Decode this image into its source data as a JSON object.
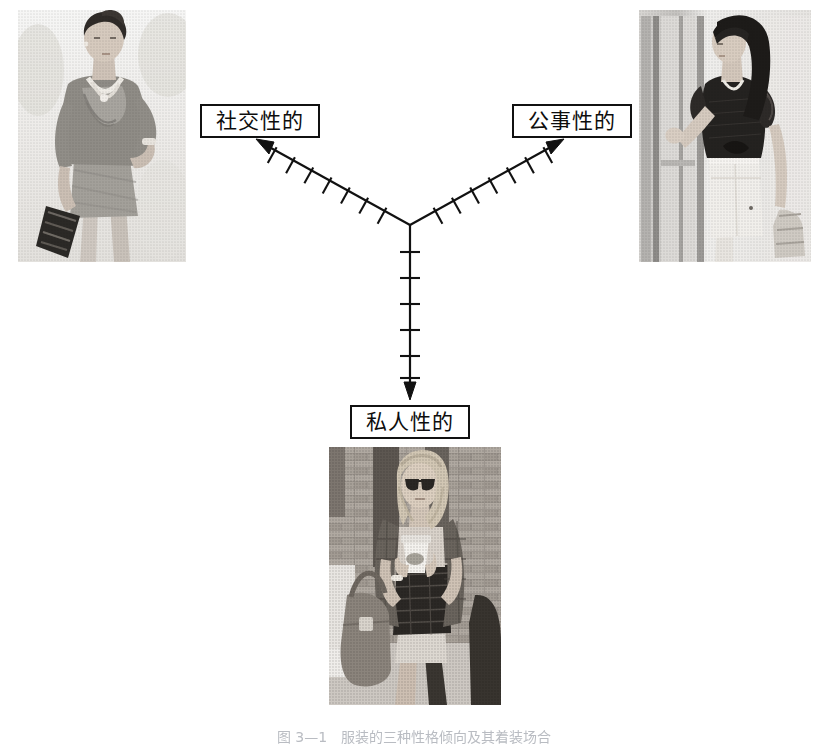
{
  "figure": {
    "type": "three-axis-diagram",
    "title": "",
    "background_color": "#ffffff",
    "line_color": "#111111",
    "junction": {
      "x": 410,
      "y": 225
    },
    "caption": "图 3—1　服装的三种性格倾向及其着装场合"
  },
  "axes": [
    {
      "id": "social",
      "label": "社交性的",
      "direction": "up-left",
      "tick_count": 7,
      "arrowhead": true,
      "start": {
        "x": 410,
        "y": 225
      },
      "end": {
        "x": 258,
        "y": 141
      },
      "label_box": {
        "x": 200,
        "y": 104,
        "width": 120,
        "height": 34
      }
    },
    {
      "id": "business",
      "label": "公事性的",
      "direction": "up-right",
      "tick_count": 7,
      "arrowhead": true,
      "start": {
        "x": 410,
        "y": 225
      },
      "end": {
        "x": 562,
        "y": 141
      },
      "label_box": {
        "x": 512,
        "y": 104,
        "width": 120,
        "height": 34
      }
    },
    {
      "id": "private",
      "label": "私人性的",
      "direction": "down",
      "tick_count": 6,
      "arrowhead": true,
      "start": {
        "x": 410,
        "y": 225
      },
      "end": {
        "x": 410,
        "y": 398
      },
      "label_box": {
        "x": 350,
        "y": 405,
        "width": 120,
        "height": 34
      }
    }
  ],
  "photos": [
    {
      "id": "photo-social",
      "position": "top-left",
      "description": "灰度照片：女性身着垂褶灰色上衣与短裙，手持手包",
      "x": 18,
      "y": 10,
      "width": 168,
      "height": 252
    },
    {
      "id": "photo-business",
      "position": "top-right",
      "description": "灰度照片：女性身着深色荷叶边衬衫与白色铅笔裙，立于门边",
      "x": 639,
      "y": 10,
      "width": 172,
      "height": 252
    },
    {
      "id": "photo-private",
      "position": "bottom-center",
      "description": "灰度照片：金发女性戴墨镜，手持咖啡杯与大号手提包，背景砖墙",
      "x": 329,
      "y": 447,
      "width": 172,
      "height": 258
    }
  ]
}
